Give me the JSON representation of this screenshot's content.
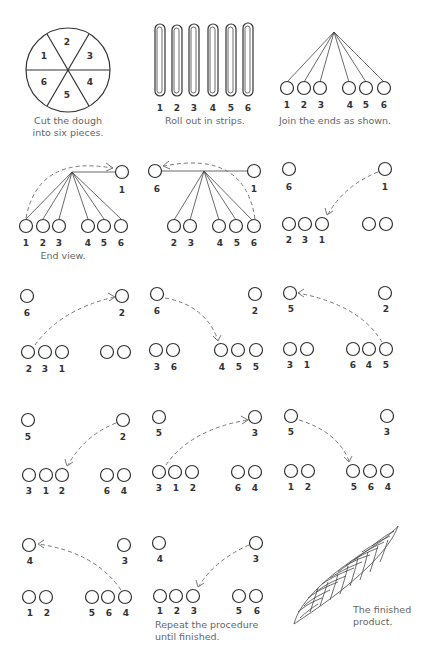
{
  "steps": [
    {
      "id": 1,
      "caption": [
        "Cut the dough",
        "into six pieces."
      ],
      "pieces": [
        "1",
        "2",
        "3",
        "4",
        "5",
        "6"
      ]
    },
    {
      "id": 2,
      "caption": [
        "Roll out in strips."
      ],
      "strips": [
        "1",
        "2",
        "3",
        "4",
        "5",
        "6"
      ]
    },
    {
      "id": 3,
      "caption": [
        "Join the ends as shown."
      ],
      "labels": [
        "1",
        "2",
        "3",
        "4",
        "5",
        "6"
      ]
    },
    {
      "id": 4,
      "caption": [
        "End view."
      ],
      "top": [
        "1"
      ],
      "bottom": [
        "1",
        "2",
        "3",
        "4",
        "5",
        "6"
      ]
    },
    {
      "id": 5,
      "top_left": "6",
      "top_right": "1",
      "bottom": [
        "2",
        "3",
        "4",
        "5",
        "6"
      ]
    },
    {
      "id": 6,
      "top_left": "6",
      "top_right": "1",
      "bottom_left": [
        "2",
        "3",
        "1"
      ],
      "bottom_right": [
        "4",
        "5"
      ]
    },
    {
      "id": 7,
      "top_left": "6",
      "top_right": "2",
      "bottom_left": [
        "2",
        "3",
        "1"
      ],
      "bottom_right": [
        "4",
        "5"
      ]
    },
    {
      "id": 8,
      "top_left": "6",
      "top_right": "2",
      "bottom_left": [
        "3",
        "1"
      ],
      "bottom_right": [
        "6",
        "4",
        "5"
      ]
    },
    {
      "id": 9,
      "top_left": "5",
      "top_right": "2",
      "bottom_left": [
        "3",
        "1"
      ],
      "bottom_right": [
        "6",
        "4",
        "5"
      ]
    },
    {
      "id": 10,
      "top_left": "5",
      "top_right": "2",
      "bottom_left": [
        "3",
        "1",
        "2"
      ],
      "bottom_right": [
        "6",
        "4"
      ]
    },
    {
      "id": 11,
      "top_left": "5",
      "top_right": "3",
      "bottom_left": [
        "3",
        "1",
        "2"
      ],
      "bottom_right": [
        "6",
        "4"
      ]
    },
    {
      "id": 12,
      "top_left": "5",
      "top_right": "3",
      "bottom_left": [
        "1",
        "2"
      ],
      "bottom_right": [
        "5",
        "6",
        "4"
      ]
    },
    {
      "id": 13,
      "top_left": "4",
      "top_right": "3",
      "bottom_left": [
        "1",
        "2"
      ],
      "bottom_right": [
        "5",
        "6",
        "4"
      ]
    },
    {
      "id": 14,
      "caption": [
        "Repeat the procedure",
        "until finished."
      ],
      "top_left": "4",
      "top_right": "3",
      "bottom_left": [
        "1",
        "2",
        "3"
      ],
      "bottom_right": [
        "5",
        "6"
      ]
    },
    {
      "id": 15,
      "caption": [
        "The finished",
        "product."
      ]
    }
  ],
  "colors": {
    "line": "#333333",
    "dash": "#777777",
    "caption": "#666666"
  }
}
